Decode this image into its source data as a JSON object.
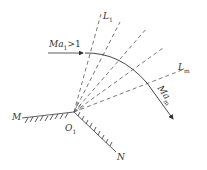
{
  "diagram": {
    "type": "prandtl-meyer-expansion-fan",
    "colors": {
      "line": "#333333",
      "dash": "#555555",
      "background": "#ffffff"
    },
    "labels": {
      "inflow": {
        "main": "Ma",
        "sub": "1",
        "suffix": ">1"
      },
      "first_wave": {
        "main": "L",
        "sub": "1"
      },
      "last_wave": {
        "main": "L",
        "sub": "m"
      },
      "outflow": {
        "main": "Ma",
        "sub": "m"
      },
      "wall_left": "M",
      "wall_right": "N",
      "corner": {
        "main": "O",
        "sub": "1"
      }
    },
    "geometry": {
      "corner": [
        74,
        112
      ],
      "mach_waves": [
        [
          101,
          14
        ],
        [
          120,
          22
        ],
        [
          147,
          28
        ],
        [
          163,
          48
        ],
        [
          182,
          70
        ]
      ],
      "wall_left_end": [
        22,
        118
      ],
      "wall_right_end": [
        116,
        152
      ]
    }
  }
}
